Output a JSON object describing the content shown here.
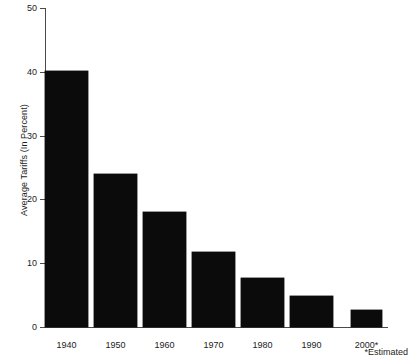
{
  "chart_data": {
    "type": "bar",
    "title": "",
    "subtitle": "",
    "xlabel": "",
    "ylabel": "Average Tariffs (In Percent)",
    "categories": [
      "1940",
      "1950",
      "1960",
      "1970",
      "1980",
      "1990",
      "2000*"
    ],
    "values": [
      40.2,
      24.0,
      18.0,
      11.7,
      7.7,
      4.8,
      2.6
    ],
    "series": [
      {
        "name": "Average Tariffs",
        "values": [
          40.2,
          24.0,
          18.0,
          11.7,
          7.7,
          4.8,
          2.6
        ]
      }
    ],
    "ylim": [
      0,
      50
    ],
    "yticks": [
      0,
      10,
      20,
      30,
      40,
      50
    ],
    "ytick_labels": [
      "0",
      "10",
      "20",
      "30",
      "40",
      "50"
    ],
    "grid": false,
    "legend": false,
    "legend_position": "none",
    "bar_color": "#0b0b0b",
    "background_color": "#ffffff",
    "axis_color": "#4a4a4a",
    "annotations": [
      "*Estimated"
    ]
  },
  "axes": {
    "y_axis_title": "Average Tariffs (In Percent)",
    "ticks": [
      {
        "label": "50",
        "value": 50
      },
      {
        "label": "40",
        "value": 40
      },
      {
        "label": "30",
        "value": 30
      },
      {
        "label": "20",
        "value": 20
      },
      {
        "label": "10",
        "value": 10
      },
      {
        "label": "0",
        "value": 0
      }
    ]
  },
  "footnote": {
    "text": "*Estimated"
  }
}
